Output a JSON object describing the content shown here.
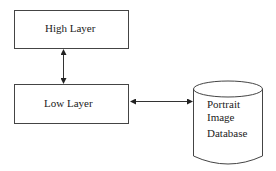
{
  "diagram": {
    "nodes": [
      {
        "id": "high",
        "label": "High Layer",
        "shape": "rectangle"
      },
      {
        "id": "low",
        "label": "Low Layer",
        "shape": "rectangle"
      },
      {
        "id": "db",
        "label_lines": [
          "Portrait",
          "Image",
          "Database"
        ],
        "shape": "cylinder"
      }
    ],
    "edges": [
      {
        "from": "high",
        "to": "low",
        "direction": "bidirectional"
      },
      {
        "from": "low",
        "to": "db",
        "direction": "bidirectional"
      }
    ],
    "colors": {
      "stroke": "#333333",
      "background": "#ffffff"
    }
  }
}
